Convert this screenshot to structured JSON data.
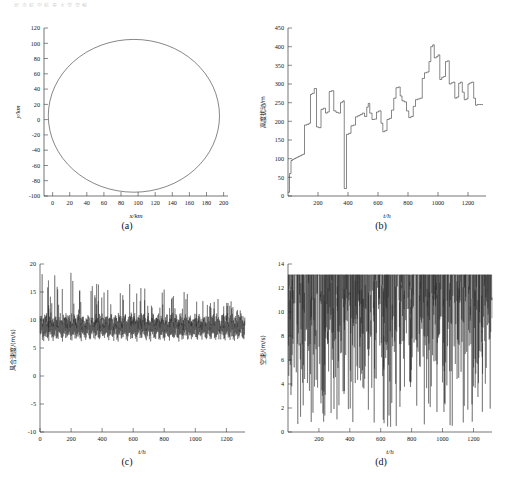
{
  "figure": {
    "header_text": "北 京 航 空 航 天 大 学 学 报",
    "width": 508,
    "height": 489,
    "line_color": "#222222",
    "axis_color": "#3a3a3a"
  },
  "panels": [
    {
      "id": "a",
      "caption": "(a)",
      "xlabel": "x/km",
      "ylabel": "y/km",
      "xticks": [
        0,
        20,
        40,
        60,
        80,
        100,
        120,
        140,
        160,
        180,
        200
      ],
      "yticks": [
        -100,
        -80,
        -60,
        -40,
        -20,
        0,
        20,
        40,
        60,
        80,
        100,
        120
      ],
      "xlim": [
        -10,
        205
      ],
      "ylim": [
        -100,
        120
      ]
    },
    {
      "id": "b",
      "caption": "(b)",
      "xlabel": "t/h",
      "ylabel": "高度扰动/m",
      "xticks": [
        200,
        400,
        600,
        800,
        1000,
        1200
      ],
      "yticks": [
        0,
        50,
        100,
        150,
        200,
        250,
        300,
        350,
        400,
        450
      ],
      "xlim": [
        0,
        1320
      ],
      "ylim": [
        0,
        450
      ]
    },
    {
      "id": "c",
      "caption": "(c)",
      "xlabel": "t/h",
      "ylabel": "风合速度/(m/s)",
      "xticks": [
        0,
        200,
        400,
        600,
        800,
        1000,
        1200
      ],
      "yticks": [
        -10,
        -5,
        0,
        5,
        10,
        15,
        20
      ],
      "xlim": [
        0,
        1320
      ],
      "ylim": [
        -10,
        20
      ]
    },
    {
      "id": "d",
      "caption": "(d)",
      "xlabel": "t/h",
      "ylabel": "空速/(m/s)",
      "xticks": [
        200,
        400,
        600,
        800,
        1000,
        1200
      ],
      "yticks": [
        0,
        2,
        4,
        6,
        8,
        10,
        12,
        14
      ],
      "xlim": [
        0,
        1320
      ],
      "ylim": [
        0,
        14
      ]
    }
  ],
  "chart_data": [
    {
      "type": "line",
      "panel": "a",
      "title": "(a)",
      "xlabel": "x/km",
      "ylabel": "y/km",
      "xlim": [
        -10,
        205
      ],
      "ylim": [
        -100,
        120
      ],
      "grid": false,
      "description": "Closed elliptical flight trajectory, center approx (95, 5) km, semi-axis x approx 100 km, semi-axis y approx 100 km",
      "ellipse": {
        "cx": 95,
        "cy": 5,
        "rx": 100,
        "ry": 100
      }
    },
    {
      "type": "line",
      "panel": "b",
      "title": "(b)",
      "xlabel": "t/h",
      "ylabel": "高度扰动/m",
      "xlim": [
        0,
        1320
      ],
      "ylim": [
        0,
        450
      ],
      "grid": false,
      "step": true,
      "x": [
        0,
        10,
        20,
        30,
        40,
        50,
        60,
        70,
        80,
        90,
        100,
        110,
        125,
        140,
        150,
        160,
        175,
        190,
        205,
        220,
        235,
        250,
        262,
        275,
        290,
        305,
        320,
        335,
        350,
        362,
        368,
        375,
        390,
        405,
        420,
        435,
        450,
        465,
        480,
        495,
        510,
        525,
        535,
        545,
        560,
        575,
        590,
        605,
        620,
        632,
        645,
        660,
        675,
        690,
        705,
        720,
        735,
        748,
        760,
        775,
        790,
        805,
        820,
        835,
        850,
        865,
        880,
        895,
        910,
        925,
        940,
        952,
        965,
        975,
        988,
        1000,
        1012,
        1025,
        1038,
        1050,
        1062,
        1075,
        1088,
        1100,
        1112,
        1125,
        1138,
        1150,
        1162,
        1175,
        1188,
        1200,
        1212,
        1225,
        1238,
        1250,
        1262,
        1275,
        1288,
        1300
      ],
      "y": [
        10,
        60,
        95,
        98,
        100,
        102,
        104,
        106,
        108,
        110,
        112,
        190,
        192,
        195,
        272,
        275,
        288,
        185,
        183,
        232,
        235,
        222,
        225,
        280,
        282,
        228,
        224,
        222,
        250,
        253,
        255,
        20,
        165,
        168,
        188,
        190,
        212,
        215,
        218,
        222,
        213,
        238,
        248,
        222,
        205,
        206,
        225,
        228,
        195,
        172,
        175,
        205,
        208,
        230,
        262,
        290,
        292,
        268,
        255,
        252,
        228,
        210,
        213,
        240,
        258,
        260,
        262,
        315,
        330,
        332,
        360,
        400,
        405,
        370,
        373,
        378,
        312,
        318,
        320,
        360,
        362,
        300,
        303,
        305,
        262,
        265,
        302,
        305,
        278,
        258,
        260,
        300,
        303,
        305,
        262,
        243,
        245,
        245,
        245,
        245
      ],
      "annotations": [
        {
          "note": "sharp narrow drop to approx 20 m near t=370 h"
        },
        {
          "note": "peak approx 405 m near t=975 h"
        }
      ]
    },
    {
      "type": "line",
      "panel": "c",
      "title": "(c)",
      "xlabel": "t/h",
      "ylabel": "风合速度/(m/s)",
      "xlim": [
        0,
        1320
      ],
      "ylim": [
        -10,
        20
      ],
      "grid": false,
      "description": "Dense high-frequency oscillation confined to the band between approx 5.5 and 19.5 m/s; peak envelope decays slightly from approx 19.5 early to approx 14 late; baseline floor near 6 m/s; no data below 5 m/s",
      "envelope": {
        "baseline": 6.0,
        "peak_start": 19.4,
        "peak_end": 13.8,
        "typical_upper": 10.0
      }
    },
    {
      "type": "line",
      "panel": "d",
      "title": "(d)",
      "xlabel": "t/h",
      "ylabel": "空速/(m/s)",
      "xlim": [
        0,
        1320
      ],
      "ylim": [
        0,
        14
      ],
      "grid": false,
      "description": "Rapid oscillation with a flat saturated ceiling at approx 13.1 m/s and deep narrow downward spikes reaching as low as approx 0.3 m/s; most troughs lie between 4 and 12 m/s",
      "envelope": {
        "ceiling": 13.1,
        "min_trough": 0.3,
        "typical_trough": 8.0
      }
    }
  ]
}
